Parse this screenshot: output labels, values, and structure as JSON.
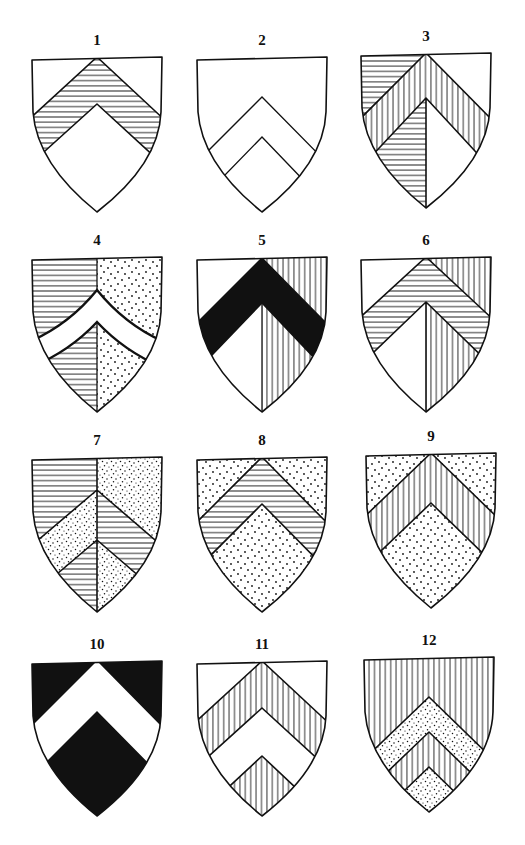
{
  "figure": {
    "tinctures": {
      "argent": "#ffffff",
      "sable": "#111111",
      "ink": "#111111",
      "horizontal_hatching": "url(#hatch-h)",
      "vertical_hatching": "url(#hatch-v)",
      "dotted": "url(#dots)",
      "fine_dotted": "url(#dots-fine)"
    },
    "shields": [
      {
        "number": "1",
        "description": "Argent, a chevron hatched horizontally",
        "field_left": "#ffffff",
        "field_right": "#ffffff",
        "chevron": "url(#hatch-h)",
        "base_left": "#ffffff",
        "base_right": "#ffffff"
      },
      {
        "number": "2",
        "description": "Argent, a chevron argent (outline only)",
        "field_left": "#ffffff",
        "field_right": "#ffffff",
        "chevron": "#ffffff",
        "base_left": "#ffffff",
        "base_right": "#ffffff"
      },
      {
        "number": "3",
        "description": "Per pale horizontal hatching and argent, a chevron vertically hatched",
        "field_left": "url(#hatch-h)",
        "field_right": "#ffffff",
        "chevron": "url(#hatch-v)",
        "base_left": "url(#hatch-h)",
        "base_right": "#ffffff"
      },
      {
        "number": "4",
        "description": "Per pale horizontal hatching and dotted, a chevron argent (curved)",
        "field_left": "url(#hatch-h)",
        "field_right": "url(#dots)",
        "chevron": "#ffffff",
        "base_left": "url(#hatch-h)",
        "base_right": "url(#dots)"
      },
      {
        "number": "5",
        "description": "Per pale argent and vertical hatching, a chevron sable",
        "field_left": "#ffffff",
        "field_right": "url(#hatch-v)",
        "chevron": "#111111",
        "base_left": "#ffffff",
        "base_right": "url(#hatch-v)"
      },
      {
        "number": "6",
        "description": "Per pale argent and vertical hatching, a chevron hatched horizontally",
        "field_left": "#ffffff",
        "field_right": "url(#hatch-v)",
        "chevron": "url(#hatch-h)",
        "base_left": "#ffffff",
        "base_right": "url(#hatch-v)"
      },
      {
        "number": "7",
        "description": "Per pale horizontal hatching and dotted, a chevron counterchanged",
        "field_left": "url(#hatch-h)",
        "field_right": "url(#dots-fine)",
        "chevron_left": "url(#dots-fine)",
        "chevron_right": "url(#hatch-h)",
        "base_left": "url(#hatch-h)",
        "base_right": "url(#dots-fine)"
      },
      {
        "number": "8",
        "description": "Dotted, a chevron hatched horizontally",
        "field_left": "url(#dots)",
        "field_right": "url(#dots)",
        "chevron": "url(#hatch-h)",
        "base_left": "url(#dots)",
        "base_right": "url(#dots)"
      },
      {
        "number": "9",
        "description": "Dotted, a chevron vertically hatched",
        "field_left": "url(#dots)",
        "field_right": "url(#dots)",
        "chevron": "url(#hatch-v)",
        "base_left": "url(#dots)",
        "base_right": "url(#dots)"
      },
      {
        "number": "10",
        "description": "Sable, a chevron argent",
        "field_left": "#111111",
        "field_right": "#111111",
        "chevron": "#ffffff",
        "base_left": "#111111",
        "base_right": "#111111"
      },
      {
        "number": "11",
        "description": "Argent, two chevrons vertically hatched",
        "field": "#ffffff",
        "chevron1": "url(#hatch-v)",
        "gap": "#ffffff",
        "chevron2": "url(#hatch-v)"
      },
      {
        "number": "12",
        "description": "Vertical hatching, two chevrons dotted",
        "field": "url(#hatch-v)",
        "chevron1": "url(#dots-fine)",
        "gap": "url(#hatch-v)",
        "chevron2": "url(#dots-fine)"
      }
    ]
  }
}
